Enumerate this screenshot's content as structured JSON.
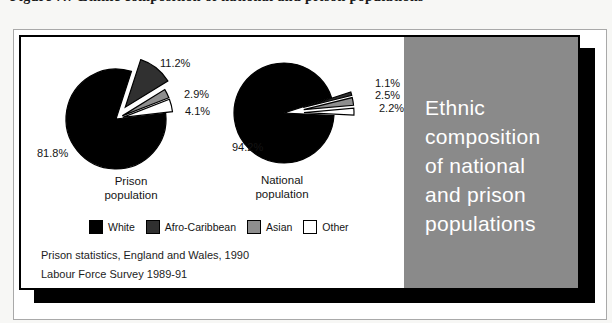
{
  "caption": "Figure 7.7   Ethnic composition of national and prison populations",
  "figure": {
    "sidebar_title": "Ethnic\ncomposition\nof national\nand prison\npopulations",
    "sources": [
      "Prison statistics, England and Wales, 1990",
      "Labour Force Survey 1989-91"
    ],
    "colors": {
      "panel_bg": "#8a8a8a",
      "panel_text": "#ffffff",
      "card_shadow": "#000000",
      "white_slice": "#000000",
      "afro_caribbean_slice": "#303030",
      "asian_slice": "#8e8e8e",
      "other_slice": "#ffffff"
    }
  },
  "legend": {
    "items": [
      {
        "label": "White",
        "color": "#000000"
      },
      {
        "label": "Afro-Caribbean",
        "color": "#303030"
      },
      {
        "label": "Asian",
        "color": "#8e8e8e"
      },
      {
        "label": "Other",
        "color": "#ffffff"
      }
    ]
  },
  "chart_data": [
    {
      "type": "pie",
      "title": "Prison\npopulation",
      "categories": [
        "White",
        "Afro-Caribbean",
        "Asian",
        "Other"
      ],
      "values": [
        81.8,
        11.2,
        2.9,
        4.1
      ],
      "slices": [
        {
          "name": "White",
          "pct": 81.8,
          "label": "81.8%",
          "color": "#000000",
          "explode": 0
        },
        {
          "name": "Afro-Caribbean",
          "pct": 11.2,
          "label": "11.2%",
          "color": "#303030",
          "explode": 15
        },
        {
          "name": "Asian",
          "pct": 2.9,
          "label": "2.9%",
          "color": "#8e8e8e",
          "explode": 7
        },
        {
          "name": "Other",
          "pct": 4.1,
          "label": "4.1%",
          "color": "#ffffff",
          "explode": 7
        }
      ],
      "geometry": {
        "cx": 95,
        "cy": 68,
        "r": 50,
        "start_deg": 6.5
      }
    },
    {
      "type": "pie",
      "title": "National\npopulation",
      "categories": [
        "White",
        "Afro-Caribbean",
        "Asian",
        "Other"
      ],
      "values": [
        94.2,
        1.1,
        2.5,
        2.2
      ],
      "slices": [
        {
          "name": "White",
          "pct": 94.2,
          "label": "94.2%",
          "color": "#000000",
          "explode": 0
        },
        {
          "name": "Afro-Caribbean",
          "pct": 1.1,
          "label": "1.1%",
          "color": "#303030",
          "explode": 20
        },
        {
          "name": "Asian",
          "pct": 2.5,
          "label": "2.5%",
          "color": "#8e8e8e",
          "explode": 20
        },
        {
          "name": "Other",
          "pct": 2.2,
          "label": "2.2%",
          "color": "#ffffff",
          "explode": 20
        }
      ],
      "geometry": {
        "cx": 93,
        "cy": 66,
        "r": 50,
        "start_deg": -2.9
      }
    }
  ]
}
